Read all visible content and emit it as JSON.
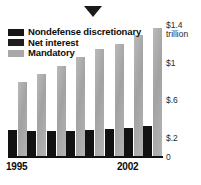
{
  "figure": {
    "pointer_icon": "down-triangle-marker"
  },
  "legend": {
    "position": "top-left",
    "items": [
      {
        "label": "Nondefense discretionary",
        "color": "#161616",
        "swatch": "dark-swatch"
      },
      {
        "label": "Net interest",
        "color": "#1e1e1e",
        "swatch": "dark-swatch"
      },
      {
        "label": "Mandatory",
        "color": "#a8a8a8",
        "swatch": "grey-swatch"
      }
    ]
  },
  "axis": {
    "y_ticks": [
      {
        "label": "$1.4",
        "unit": "trillion",
        "value": 1.4
      },
      {
        "label": "$1",
        "unit": "",
        "value": 1.0
      },
      {
        "label": "$.6",
        "unit": "",
        "value": 0.6
      },
      {
        "label": "$.2",
        "unit": "",
        "value": 0.2
      },
      {
        "label": "0",
        "unit": "",
        "value": 0
      }
    ],
    "x_start": "1995",
    "x_end": "2002"
  },
  "chart_data": {
    "type": "bar",
    "title": "",
    "subtitle": "",
    "xlabel": "",
    "ylabel": "$1.4 trillion",
    "ylim": [
      0,
      1.4
    ],
    "grid": false,
    "legend_position": "top-left",
    "categories": [
      "1995",
      "1996",
      "1997",
      "1998",
      "1999",
      "2000",
      "2001",
      "2002"
    ],
    "series": [
      {
        "name": "Nondefense discretionary + Net interest",
        "color": "#121212",
        "values": [
          0.28,
          0.27,
          0.27,
          0.27,
          0.28,
          0.29,
          0.3,
          0.32
        ]
      },
      {
        "name": "Mandatory",
        "color": "#a8a8a8",
        "values": [
          0.79,
          0.87,
          0.95,
          1.05,
          1.13,
          1.19,
          1.28,
          1.36
        ]
      }
    ],
    "annotations": [
      {
        "type": "marker",
        "shape": "down-triangle",
        "x": 0.42,
        "note": ""
      }
    ]
  }
}
